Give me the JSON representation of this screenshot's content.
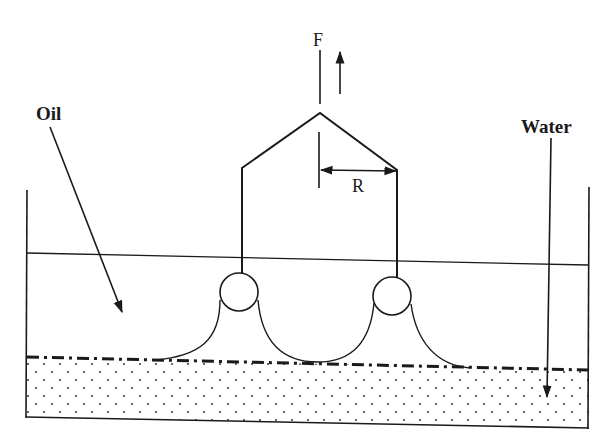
{
  "diagram": {
    "title": "",
    "labels": {
      "force": "F",
      "radius": "R",
      "oil": "Oil",
      "water": "Water"
    },
    "colors": {
      "ink": "#1a1a1a",
      "background": "#ffffff",
      "water_dots": "#444444"
    },
    "elements": [
      {
        "name": "container",
        "type": "open-top tank",
        "left_wall_x": 27,
        "right_wall_x": 588
      },
      {
        "name": "oil-surface",
        "type": "line",
        "from": [
          27,
          253
        ],
        "to": [
          588,
          265
        ]
      },
      {
        "name": "oil-water-interface",
        "type": "dash-dot line",
        "from": [
          27,
          357
        ],
        "to": [
          588,
          370
        ]
      },
      {
        "name": "water-layer",
        "type": "dotted fill region"
      },
      {
        "name": "left-ring",
        "type": "circle",
        "center": [
          239,
          292
        ],
        "r": 19
      },
      {
        "name": "right-ring",
        "type": "circle",
        "center": [
          392,
          296
        ],
        "r": 19
      },
      {
        "name": "frame",
        "type": "polyline",
        "points": [
          [
            242,
            272
          ],
          [
            242,
            168
          ],
          [
            320,
            113
          ],
          [
            397,
            170
          ],
          [
            397,
            277
          ]
        ]
      },
      {
        "name": "meniscus",
        "type": "curve",
        "description": "oil meniscus hanging from both rings down to interface"
      },
      {
        "name": "force-arrow",
        "type": "arrow",
        "direction": "up"
      },
      {
        "name": "radius-dimension",
        "type": "double-arrow",
        "from": [
          320,
          170
        ],
        "to": [
          397,
          170
        ]
      }
    ]
  }
}
